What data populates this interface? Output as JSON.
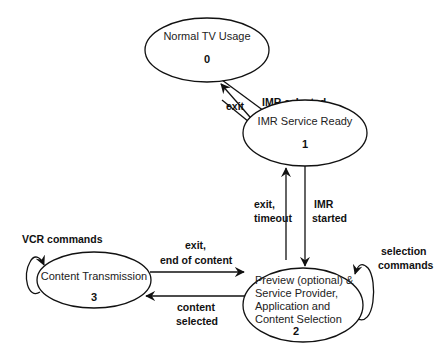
{
  "diagram": {
    "type": "state-transition",
    "states": [
      {
        "id": 0,
        "name_lines": [
          "Normal TV Usage"
        ],
        "number": "0"
      },
      {
        "id": 1,
        "name_lines": [
          "IMR Service Ready"
        ],
        "number": "1"
      },
      {
        "id": 2,
        "name_lines": [
          "Preview (optional) &",
          "Service Provider,",
          "Application and",
          "Content Selection"
        ],
        "number": "2"
      },
      {
        "id": 3,
        "name_lines": [
          "Content Transmission"
        ],
        "number": "3"
      }
    ],
    "transitions": [
      {
        "from": 0,
        "to": 1,
        "label_lines": [
          "IMR selected"
        ]
      },
      {
        "from": 1,
        "to": 0,
        "label_lines": [
          "exit"
        ]
      },
      {
        "from": 1,
        "to": 2,
        "label_lines": [
          "IMR",
          "started"
        ]
      },
      {
        "from": 2,
        "to": 1,
        "label_lines": [
          "exit,",
          "timeout"
        ]
      },
      {
        "from": 2,
        "to": 3,
        "label_lines": [
          "content",
          "selected"
        ]
      },
      {
        "from": 3,
        "to": 2,
        "label_lines": [
          "exit,",
          "end of content"
        ]
      },
      {
        "from": 3,
        "to": 3,
        "label_lines": [
          "VCR commands"
        ]
      },
      {
        "from": 2,
        "to": 2,
        "label_lines": [
          "selection",
          "commands"
        ]
      }
    ]
  }
}
